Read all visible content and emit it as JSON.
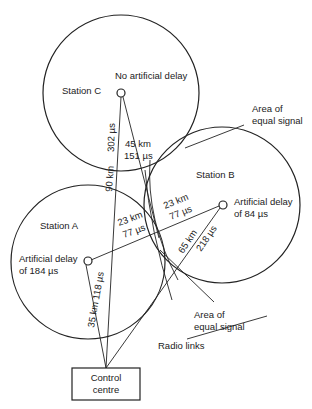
{
  "stations": {
    "c": {
      "name": "Station C",
      "delay": "No artificial delay"
    },
    "a": {
      "name": "Station A",
      "delay_line1": "Artificial delay",
      "delay_line2": "of 184 µs"
    },
    "b": {
      "name": "Station B",
      "delay_line1": "Artificial delay",
      "delay_line2": "of 84 µs"
    }
  },
  "links": {
    "c_to_control_time": "302 µs",
    "c_to_control_distance": "90 km",
    "c_to_equal_distance": "45 km",
    "c_to_equal_time": "151 µs",
    "a_to_b_left_distance": "23 km",
    "a_to_b_left_time": "77 µs",
    "a_to_b_right_distance": "23 km",
    "a_to_b_right_time": "77 µs",
    "b_to_control_distance": "65 km",
    "b_to_control_time": "218 µs",
    "a_to_control": "35 km 118 µs"
  },
  "annotations": {
    "equal_signal_top_line1": "Area of",
    "equal_signal_top_line2": "equal signal",
    "equal_signal_bottom_line1": "Area of",
    "equal_signal_bottom_line2": "equal signal",
    "radio_links": "Radio links"
  },
  "control": {
    "line1": "Control",
    "line2": "centre"
  }
}
